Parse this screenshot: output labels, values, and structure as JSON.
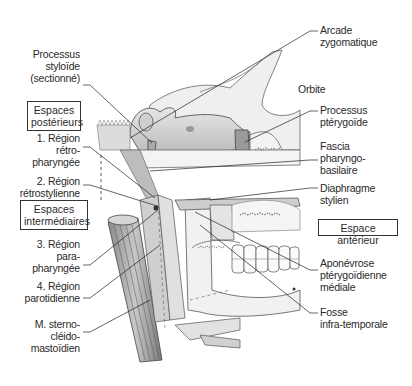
{
  "figure": {
    "labels_left": [
      {
        "id": "processus-styloide",
        "text": "Processus\nstyloïde\n(sectionné)"
      },
      {
        "id": "region-retro-pharyngee",
        "text": "1. Région\nrétro-\npharyngée"
      },
      {
        "id": "region-retrostylienne",
        "text": "2. Région\nrétrostylienne"
      },
      {
        "id": "region-para-pharyngee",
        "text": "3. Région\npara-\npharyngée"
      },
      {
        "id": "region-parotidienne",
        "text": "4. Région\nparotidienne"
      },
      {
        "id": "muscle-sterno-cleido-mastoidien",
        "text": "M. sterno-\ncléido-\nmastoïdien"
      }
    ],
    "labels_right": [
      {
        "id": "arcade-zygomatique",
        "text": "Arcade\nzygomatique"
      },
      {
        "id": "orbite",
        "text": "Orbite"
      },
      {
        "id": "processus-pterygoide",
        "text": "Processus\nptérygoïde"
      },
      {
        "id": "fascia-pharyngo-basilaire",
        "text": "Fascia\npharyngo-\nbasilaire"
      },
      {
        "id": "diaphragme-stylien",
        "text": "Diaphragme\nstylien"
      },
      {
        "id": "aponevrose-pterygoidienne-mediale",
        "text": "Aponévrose\nptérygoïdienne\nmédiale"
      },
      {
        "id": "fosse-infra-temporale",
        "text": "Fosse\ninfra-temporale"
      }
    ],
    "boxes": [
      {
        "id": "espaces-posterieurs",
        "text": "Espaces\npostérieurs"
      },
      {
        "id": "espaces-intermediaires",
        "text": "Espaces\nintermédiaires"
      },
      {
        "id": "espace-anterieur",
        "text": "Espace antérieur"
      }
    ]
  }
}
